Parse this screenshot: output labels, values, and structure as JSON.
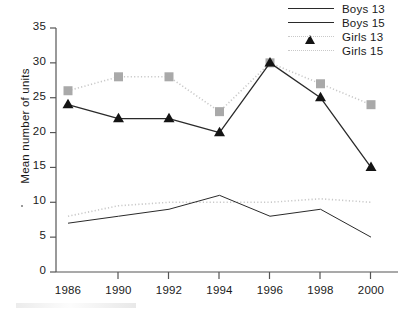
{
  "chart_data": {
    "type": "line",
    "title": "",
    "xlabel": "",
    "ylabel": "Mean number of units",
    "categories": [
      "1986",
      "1990",
      "1992",
      "1994",
      "1996",
      "1998",
      "2000"
    ],
    "ylim": [
      0,
      35
    ],
    "yticks": [
      "0",
      "5",
      "10",
      "15",
      "20",
      "25",
      "30",
      "35"
    ],
    "grid": false,
    "legend_position": "top-right",
    "series": [
      {
        "name": "Boys 13",
        "values": [
          7,
          8,
          9,
          11,
          8,
          9,
          5
        ],
        "color": "#2a2a2a",
        "line_style": "solid",
        "marker": "none"
      },
      {
        "name": "Boys 15",
        "values": [
          24,
          22,
          22,
          20,
          30,
          25,
          15
        ],
        "color": "#2a2a2a",
        "line_style": "solid",
        "marker": "triangle",
        "marker_color": "#141414"
      },
      {
        "name": "Girls 13",
        "values": [
          8,
          9.5,
          10,
          10,
          10,
          10.5,
          10
        ],
        "color": "#c9c9c9",
        "line_style": "dotted",
        "marker": "none"
      },
      {
        "name": "Girls 15",
        "values": [
          26,
          28,
          28,
          23,
          30,
          27,
          24
        ],
        "color": "#c9c9c9",
        "line_style": "dotted",
        "marker": "square",
        "marker_color": "#a9a9a9"
      }
    ]
  },
  "legend": {
    "items": [
      {
        "label": "Boys 13",
        "key": "solid-thin-line"
      },
      {
        "label": "Boys 15",
        "key": "solid-line-triangle-marker"
      },
      {
        "label": "Girls 13",
        "key": "dotted-line"
      },
      {
        "label": "Girls 15",
        "key": "dotted-line-square-marker"
      }
    ]
  },
  "axes": {
    "y_title": "Mean number of units",
    "y_ticks": [
      "35",
      "30",
      "25",
      "20",
      "15",
      "10",
      "5",
      "0"
    ],
    "x_ticks": [
      "1986",
      "1990",
      "1992",
      "1994",
      "1996",
      "1998",
      "2000"
    ]
  }
}
